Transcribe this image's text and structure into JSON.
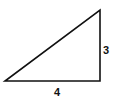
{
  "diagram": {
    "type": "right-triangle",
    "vertical_side_label": "3",
    "horizontal_side_label": "4",
    "stroke_color": "#111111",
    "background": "#ffffff"
  }
}
